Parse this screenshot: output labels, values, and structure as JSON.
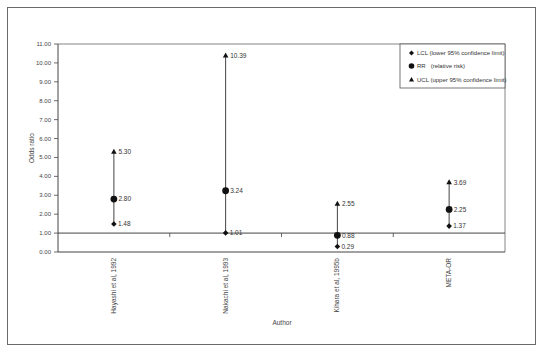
{
  "chart_data": {
    "type": "scatter",
    "subtype": "interval-plot",
    "title": "",
    "xlabel": "Author",
    "ylabel": "Odds ratio",
    "ylim": [
      0,
      11
    ],
    "yticks": [
      "0.00",
      "1.00",
      "2.00",
      "3.00",
      "4.00",
      "5.00",
      "6.00",
      "7.00",
      "8.00",
      "9.00",
      "10.00",
      "11.00"
    ],
    "reference_line": 1.0,
    "grid": false,
    "legend_position": "top-right",
    "categories": [
      "Hayashi et al, 1992",
      "Nakachi et al, 1993",
      "Kihara et al, 1995b",
      "META-OR"
    ],
    "series": [
      {
        "name": "LCL (lower 95% confidence limit)",
        "marker": "diamond",
        "values": [
          1.48,
          1.01,
          0.29,
          1.37
        ],
        "labels": [
          "1.48",
          "1.01",
          "0.29",
          "1.37"
        ]
      },
      {
        "name": "RR  (relative risk)",
        "marker": "circle",
        "values": [
          2.8,
          3.24,
          0.88,
          2.25
        ],
        "labels": [
          "2.80",
          "3.24",
          "0.88",
          "2.25"
        ]
      },
      {
        "name": "UCL (upper 95% confidence limit)",
        "marker": "triangle",
        "values": [
          5.3,
          10.39,
          2.55,
          3.69
        ],
        "labels": [
          "5.30",
          "10.39",
          "2.55",
          "3.69"
        ]
      }
    ]
  },
  "legend": {
    "items": [
      {
        "label": "LCL (lower 95% confidence limit)",
        "icon": "diamond-icon"
      },
      {
        "label": "RR   (relative risk)",
        "icon": "circle-icon"
      },
      {
        "label": "UCL (upper 95% confidence limit)",
        "icon": "triangle-icon"
      }
    ]
  }
}
